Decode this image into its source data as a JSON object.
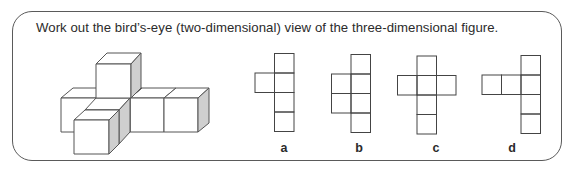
{
  "question": {
    "text": "Work out the bird’s-eye (two-dimensional) view of the three-dimensional figure."
  },
  "figure": {
    "colors": {
      "edge": "#555555",
      "face": "#ffffff",
      "shaded_side": "#cfcfcf"
    }
  },
  "options": [
    {
      "label": "a",
      "cells": [
        [
          1,
          0
        ],
        [
          0,
          1
        ],
        [
          1,
          1
        ],
        [
          1,
          2
        ],
        [
          1,
          3
        ]
      ]
    },
    {
      "label": "b",
      "cells": [
        [
          1,
          0
        ],
        [
          0,
          1
        ],
        [
          1,
          1
        ],
        [
          0,
          2
        ],
        [
          1,
          2
        ],
        [
          1,
          3
        ]
      ]
    },
    {
      "label": "c",
      "cells": [
        [
          1,
          0
        ],
        [
          0,
          1
        ],
        [
          1,
          1
        ],
        [
          2,
          1
        ],
        [
          1,
          2
        ],
        [
          1,
          3
        ]
      ]
    },
    {
      "label": "d",
      "cells": [
        [
          2,
          0
        ],
        [
          0,
          1
        ],
        [
          1,
          1
        ],
        [
          2,
          1
        ],
        [
          2,
          2
        ],
        [
          2,
          3
        ]
      ]
    }
  ]
}
